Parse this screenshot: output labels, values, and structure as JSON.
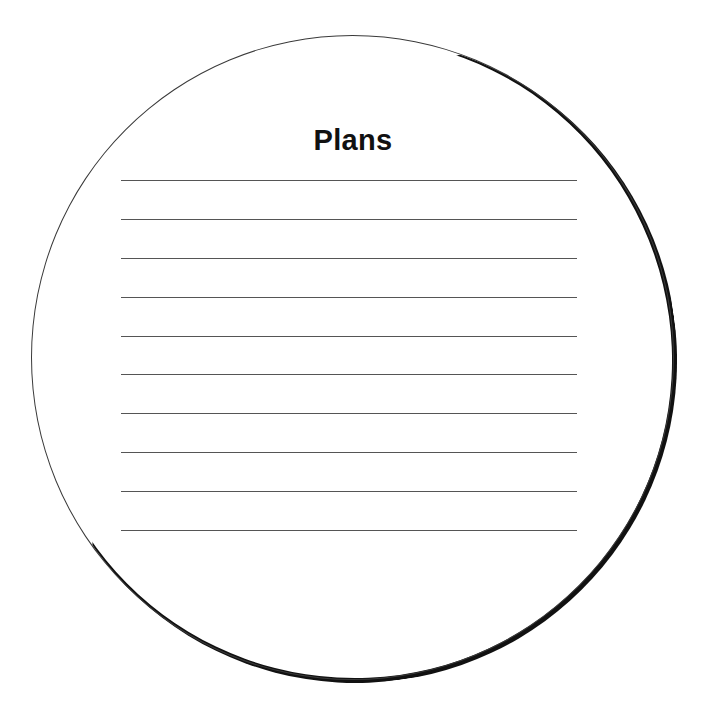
{
  "worksheet": {
    "title": "Plans",
    "line_count": 10,
    "lines": [
      {
        "index": 1,
        "value": ""
      },
      {
        "index": 2,
        "value": ""
      },
      {
        "index": 3,
        "value": ""
      },
      {
        "index": 4,
        "value": ""
      },
      {
        "index": 5,
        "value": ""
      },
      {
        "index": 6,
        "value": ""
      },
      {
        "index": 7,
        "value": ""
      },
      {
        "index": 8,
        "value": ""
      },
      {
        "index": 9,
        "value": ""
      },
      {
        "index": 10,
        "value": ""
      }
    ],
    "colors": {
      "background": "#ffffff",
      "outline": "#3a3a3a",
      "shadow": "#111111",
      "rule_lines": "#555555",
      "title_text": "#111111"
    }
  }
}
